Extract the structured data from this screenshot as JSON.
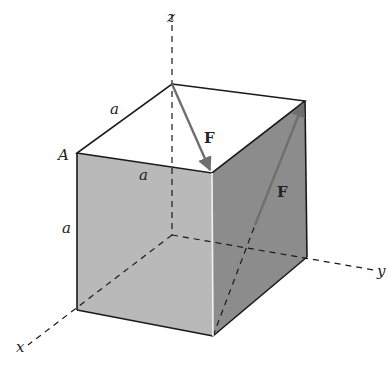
{
  "figure": {
    "axes": {
      "x": "x",
      "y": "y",
      "z": "z"
    },
    "vertex_label": "A",
    "edge_labels": [
      "a",
      "a",
      "a"
    ],
    "force_labels": [
      "F",
      "F"
    ],
    "colors": {
      "front_face": "#b9b9b9",
      "right_face": "#8c8c8c",
      "top_face": "#ffffff",
      "edge": "#1a1a1a",
      "arrow": "#6f6f6f"
    }
  }
}
